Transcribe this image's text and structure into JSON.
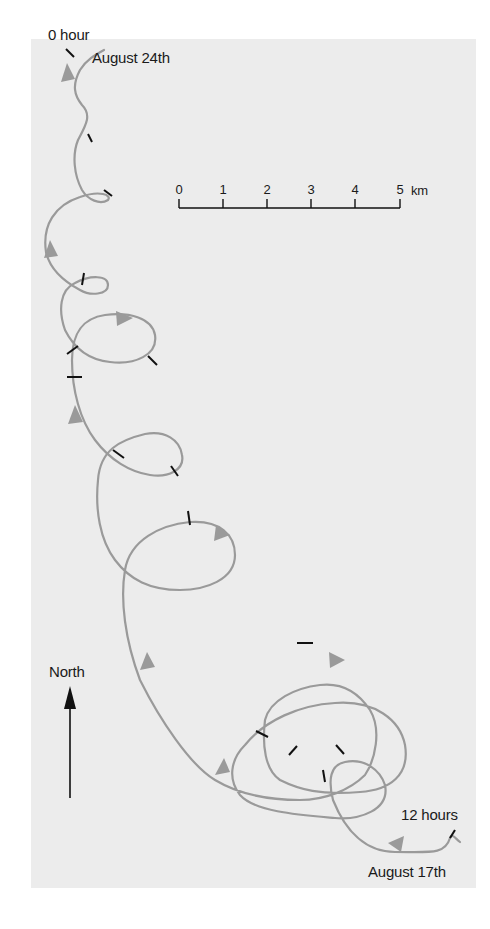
{
  "figure": {
    "type": "drift trajectory map",
    "panel_color": "#ececec",
    "track_color": "#9a9a9a",
    "tick_color": "#111111"
  },
  "labels": {
    "start_time": "0 hour",
    "start_date": "August 24th",
    "end_time": "12 hours",
    "end_date": "August 17th",
    "north": "North"
  },
  "scale_bar": {
    "ticks": [
      "0",
      "1",
      "2",
      "3",
      "4",
      "5"
    ],
    "unit": "km"
  }
}
